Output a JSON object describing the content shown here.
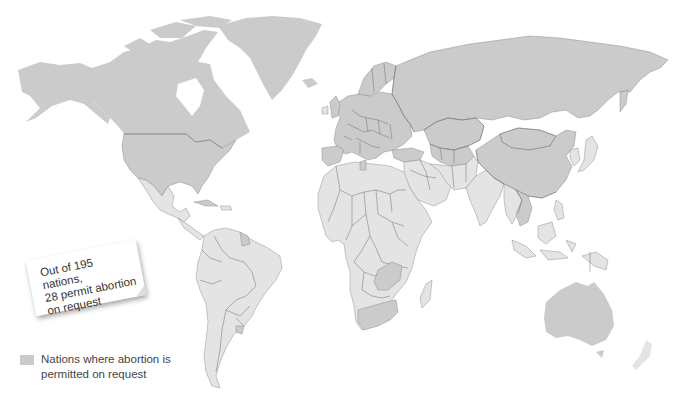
{
  "colors": {
    "permitted_on_request": "#cbcbcb",
    "other_nations": "#e4e4e4",
    "border": "#7a7a7a",
    "background": "#ffffff"
  },
  "note": {
    "text": "Out of 195 nations, 28 permit abortion on request",
    "line1": "Out of 195 nations,",
    "line2": "28 permit abortion",
    "line3": "on request"
  },
  "legend": {
    "items": [
      {
        "label": "Nations where abortion is permitted on request",
        "color": "#cbcbcb"
      }
    ]
  },
  "stats": {
    "total_nations": 195,
    "permit_on_request": 28
  },
  "highlighted_regions": [
    "United States",
    "Canada",
    "Greenland",
    "Russia",
    "China",
    "Mongolia",
    "Kazakhstan",
    "Europe (most)",
    "Turkey",
    "Central Asia",
    "Vietnam",
    "Cambodia",
    "Australia",
    "Zambia",
    "South Africa",
    "Cuba",
    "Guyana",
    "Uruguay",
    "Tunisia"
  ]
}
